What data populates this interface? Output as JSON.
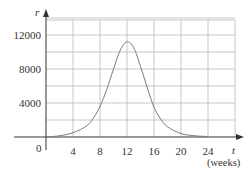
{
  "chart_data": {
    "type": "line",
    "title": "",
    "xlabel": "t",
    "xlabel_unit": "(weeks)",
    "ylabel": "r",
    "xlim": [
      0,
      28
    ],
    "ylim": [
      0,
      14000
    ],
    "grid": true,
    "x_ticks": [
      4,
      8,
      12,
      16,
      20,
      24
    ],
    "x_tick_labels": [
      "4",
      "8",
      "12",
      "16",
      "20",
      "24"
    ],
    "y_ticks": [
      4000,
      8000,
      12000
    ],
    "y_tick_labels": [
      "4000",
      "8000",
      "12000"
    ],
    "origin_label": "0",
    "series": [
      {
        "name": "r(t)",
        "x": [
          0,
          2,
          4,
          6,
          7,
          8,
          9,
          10,
          11,
          12,
          13,
          14,
          15,
          16,
          17,
          18,
          20,
          22,
          24
        ],
        "values": [
          0,
          150,
          500,
          1300,
          2200,
          3600,
          5600,
          8000,
          10200,
          11200,
          10500,
          8300,
          5800,
          3500,
          2100,
          1200,
          400,
          150,
          50
        ]
      }
    ],
    "colors": {
      "curve": "#7a7a7a",
      "grid": "#b8b8b8",
      "axis": "#333333"
    }
  }
}
